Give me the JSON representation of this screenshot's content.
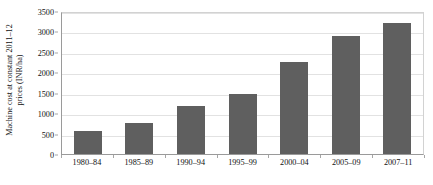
{
  "chart_data": {
    "type": "bar",
    "title": "",
    "xlabel": "",
    "ylabel": "Machine cost at constant 2011–12 prices (INR/ha)",
    "ylabel_line1": "Machine cost at constant 2011–12",
    "ylabel_line2": "prices (INR/ha)",
    "categories": [
      "1980–84",
      "1985–89",
      "1990–94",
      "1995–99",
      "2000–04",
      "2005–09",
      "2007–11"
    ],
    "values": [
      560,
      760,
      1180,
      1480,
      2250,
      2880,
      3200
    ],
    "ylim": [
      0,
      3500
    ],
    "ytick_values": [
      0,
      500,
      1000,
      1500,
      2000,
      2500,
      3000,
      3500
    ],
    "ytick_labels": [
      "0",
      "500",
      "1000",
      "1500",
      "2000",
      "2500",
      "3000",
      "3500"
    ],
    "grid": true,
    "legend": false,
    "bar_color": "#5f5f5f",
    "grid_color": "#e2e2e2",
    "axis_color": "#9a9a9a",
    "background": "#ffffff"
  }
}
